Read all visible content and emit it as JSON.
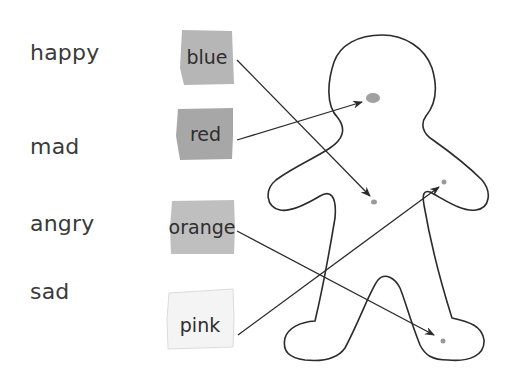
{
  "emotions": [
    {
      "label": "happy"
    },
    {
      "label": "mad"
    },
    {
      "label": "angry"
    },
    {
      "label": "sad"
    }
  ],
  "colors": [
    {
      "label": "blue",
      "fill": "#a9a9a9"
    },
    {
      "label": "red",
      "fill": "#9d9d9d"
    },
    {
      "label": "orange",
      "fill": "#b4b4b4"
    },
    {
      "label": "pink",
      "fill": "#f4f4f4"
    }
  ],
  "body_figure": {
    "name": "body-outline",
    "stroke": "#2b2b2b"
  },
  "arrows": [
    {
      "from": "blue",
      "to": "chest-left"
    },
    {
      "from": "red",
      "to": "head"
    },
    {
      "from": "orange",
      "to": "right-foot"
    },
    {
      "from": "pink",
      "to": "chest-right"
    }
  ],
  "spot_color": "#9a9a9a"
}
